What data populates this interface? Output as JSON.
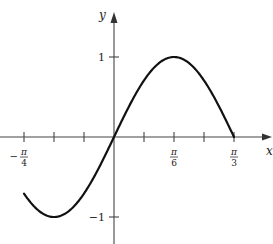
{
  "chart_data": {
    "type": "line",
    "title": "",
    "xlabel": "x",
    "ylabel": "y",
    "function": "y = sin(3x)",
    "xlim": [
      -0.7854,
      1.0472
    ],
    "ylim": [
      -1.3,
      1.3
    ],
    "grid": false,
    "x_ticks": [
      "-π/4",
      "",
      "",
      "0",
      "",
      "π/6",
      "",
      "π/3"
    ],
    "x_tick_values": [
      -0.7854,
      -0.5236,
      -0.2618,
      0,
      0.2618,
      0.5236,
      0.7854,
      1.0472
    ],
    "x_tick_labels": [
      {
        "num": "π",
        "den": "4",
        "sign": "−",
        "at": -0.7854
      },
      {
        "num": "π",
        "den": "6",
        "sign": "",
        "at": 0.5236
      },
      {
        "num": "π",
        "den": "3",
        "sign": "",
        "at": 1.0472
      }
    ],
    "y_tick_labels": [
      {
        "text": "1",
        "at": 1
      },
      {
        "text": "−1",
        "at": -1
      }
    ],
    "series": [
      {
        "name": "sin(3x)",
        "x": [
          -0.7854,
          -0.5236,
          -0.2618,
          0,
          0.2618,
          0.5236,
          0.7854,
          1.0472
        ],
        "values": [
          -0.707,
          -1,
          -0.707,
          0,
          0.707,
          1,
          0.707,
          0
        ]
      }
    ]
  },
  "labels": {
    "x_axis": "x",
    "y_axis": "y"
  }
}
